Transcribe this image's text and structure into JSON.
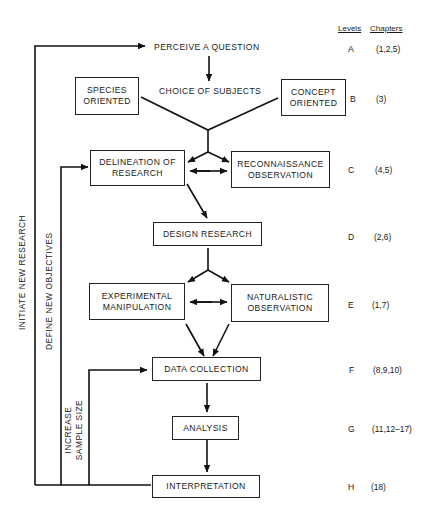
{
  "header": {
    "levels_label": "Levels",
    "chapters_label": "Chapters"
  },
  "nodes": {
    "perceive": "PERCEIVE A QUESTION",
    "choice": "CHOICE OF SUBJECTS",
    "species": "SPECIES\nORIENTED",
    "concept": "CONCEPT\nORIENTED",
    "delineation": "DELINEATION OF\nRESEARCH",
    "reconnaissance": "RECONNAISSANCE\nOBSERVATION",
    "design": "DESIGN RESEARCH",
    "experimental": "EXPERIMENTAL\nMANIPULATION",
    "naturalistic": "NATURALISTIC\nOBSERVATION",
    "data_collection": "DATA COLLECTION",
    "analysis": "ANALYSIS",
    "interpretation": "INTERPRETATION"
  },
  "feedback": {
    "initiate": "INITIATE NEW RESEARCH",
    "define": "DEFINE NEW OBJECTIVES",
    "increase": "INCREASE\nSAMPLE SIZE"
  },
  "levels": [
    {
      "level": "A",
      "chapters": "(1,2,5)"
    },
    {
      "level": "B",
      "chapters": "(3)"
    },
    {
      "level": "C",
      "chapters": "(4,5)"
    },
    {
      "level": "D",
      "chapters": "(2,6)"
    },
    {
      "level": "E",
      "chapters": "(1,7)"
    },
    {
      "level": "F",
      "chapters": "(8,9,10)"
    },
    {
      "level": "G",
      "chapters": "(11,12–17)"
    },
    {
      "level": "H",
      "chapters": "(18)"
    }
  ]
}
